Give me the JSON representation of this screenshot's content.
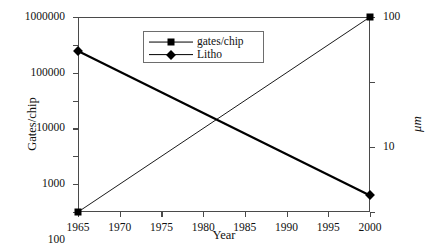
{
  "chart_data": {
    "type": "line",
    "title": "",
    "xlabel": "Year",
    "ylabel": "Gates/chip",
    "ylabel_right": "μm",
    "xlim": [
      1965,
      2000
    ],
    "ylim": [
      0.1,
      1000000
    ],
    "ylim_right": [
      0.1,
      100
    ],
    "yscale": "log",
    "yscale_right": "log",
    "grid": false,
    "legend_position": "upper-left-inside",
    "x_ticks": [
      "1965",
      "1970",
      "1975",
      "1980",
      "1985",
      "1990",
      "1995",
      "2000"
    ],
    "x_tick_values": [
      1965,
      1970,
      1975,
      1980,
      1985,
      1990,
      1995,
      2000
    ],
    "y_ticks_left": [
      "1000000",
      "100000",
      "10000",
      "1000",
      "100",
      "10",
      "1",
      "0.1"
    ],
    "y_tick_values_left": [
      1000000,
      100000,
      10000,
      1000,
      100,
      10,
      1,
      0.1
    ],
    "y_ticks_right": [
      "100",
      "10",
      "1",
      "0.1"
    ],
    "y_tick_values_right": [
      100,
      10,
      1,
      0.1
    ],
    "series": [
      {
        "name": "gates/chip",
        "axis": "left",
        "marker": "square",
        "line_width": "thin",
        "color": "#000000",
        "x": [
          1965,
          2000
        ],
        "values": [
          0.1,
          1000000
        ]
      },
      {
        "name": "Litho",
        "axis": "right",
        "marker": "diamond",
        "line_width": "thick",
        "color": "#000000",
        "x": [
          1965,
          2000
        ],
        "values": [
          30,
          0.18
        ]
      }
    ]
  },
  "axes": {
    "x_title": "Year",
    "y_title_left": "Gates/chip",
    "y_title_right": "μm"
  },
  "legend": {
    "entries": [
      {
        "label": "gates/chip"
      },
      {
        "label": "Litho"
      }
    ]
  }
}
